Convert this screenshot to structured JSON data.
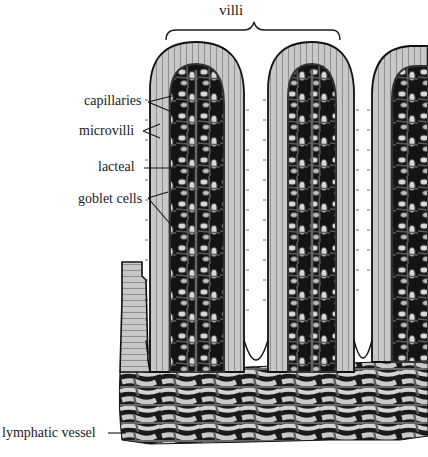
{
  "diagram": {
    "group_label": "villi",
    "labels": [
      {
        "id": "capillaries",
        "text": "capillaries",
        "x": 84,
        "y": 94
      },
      {
        "id": "microvilli",
        "text": "microvilli",
        "x": 79,
        "y": 124
      },
      {
        "id": "lacteal",
        "text": "lacteal",
        "x": 98,
        "y": 160
      },
      {
        "id": "goblet-cells",
        "text": "goblet cells",
        "x": 78,
        "y": 192
      },
      {
        "id": "lymphatic-vessel",
        "text": "lymphatic vessel",
        "x": 2,
        "y": 426
      }
    ],
    "colors": {
      "epithelium": "#c8c8c8",
      "epithelium_cell_line": "#3a3a3a",
      "core": "#4a4a4a",
      "core_dark": "#141414",
      "core_light": "#d8d8d8",
      "outline": "#111111",
      "background": "#ffffff"
    }
  }
}
